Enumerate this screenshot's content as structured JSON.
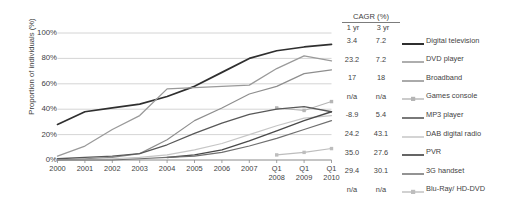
{
  "chart_data": {
    "type": "line",
    "title": "",
    "xlabel": "",
    "ylabel": "Proportion of individuals (%)",
    "ylim": [
      0,
      100
    ],
    "grid": true,
    "legend_position": "right",
    "y_ticks": [
      "0%",
      "20%",
      "40%",
      "60%",
      "80%",
      "100%"
    ],
    "y_tick_values": [
      0,
      20,
      40,
      60,
      80,
      100
    ],
    "categories": [
      "2000",
      "2001",
      "2002",
      "2003",
      "2004",
      "2005",
      "2006",
      "2007",
      "Q1 2008",
      "Q1 2009",
      "Q1 2010"
    ],
    "x_tick_lines": [
      [
        "2000",
        ""
      ],
      [
        "2001",
        ""
      ],
      [
        "2002",
        ""
      ],
      [
        "2003",
        ""
      ],
      [
        "2004",
        ""
      ],
      [
        "2005",
        ""
      ],
      [
        "2006",
        ""
      ],
      [
        "2007",
        ""
      ],
      [
        "Q1",
        "2008"
      ],
      [
        "Q1",
        "2009"
      ],
      [
        "Q1",
        "2010"
      ]
    ],
    "series": [
      {
        "name": "Digital television",
        "color": "#2f2f2f",
        "width": 1.7,
        "style": "solid",
        "marker": "none",
        "cagr_1yr": "3.4",
        "cagr_3yr": "7.2",
        "values": [
          28,
          38,
          41,
          44,
          50,
          58,
          69,
          80,
          86,
          89,
          91
        ]
      },
      {
        "name": "DVD player",
        "color": "#9a9a9a",
        "width": 1.3,
        "style": "solid",
        "marker": "none",
        "cagr_1yr": "23.2",
        "cagr_3yr": "7.2",
        "values": [
          3,
          11,
          24,
          35,
          56,
          57,
          58,
          59,
          72,
          82,
          78
        ]
      },
      {
        "name": "Broadband",
        "color": "#8e8e8e",
        "width": 1.2,
        "style": "solid",
        "marker": "none",
        "cagr_1yr": "17",
        "cagr_3yr": "18",
        "values": [
          0,
          1,
          2,
          5,
          16,
          31,
          41,
          52,
          58,
          68,
          71
        ]
      },
      {
        "name": "Games console",
        "color": "#b5b5b5",
        "width": 1.1,
        "style": "marker-line",
        "marker": "square",
        "cagr_1yr": "n/a",
        "cagr_3yr": "n/a",
        "values": [
          null,
          null,
          null,
          null,
          null,
          null,
          null,
          null,
          41,
          39,
          46
        ]
      },
      {
        "name": "MP3 player",
        "color": "#585858",
        "width": 1.3,
        "style": "solid",
        "marker": "none",
        "cagr_1yr": "-8.9",
        "cagr_3yr": "5.4",
        "values": [
          1,
          2,
          3,
          5,
          12,
          21,
          29,
          36,
          40,
          42,
          38
        ]
      },
      {
        "name": "DAB digital radio",
        "color": "#c6c6c6",
        "width": 1.2,
        "style": "solid",
        "marker": "none",
        "cagr_1yr": "24.2",
        "cagr_3yr": "43.1",
        "values": [
          0,
          0,
          1,
          2,
          4,
          8,
          13,
          20,
          27,
          33,
          35
        ]
      },
      {
        "name": "PVR",
        "color": "#4a4a4a",
        "width": 1.4,
        "style": "solid",
        "marker": "none",
        "cagr_1yr": "35.0",
        "cagr_3yr": "27.6",
        "values": [
          null,
          null,
          null,
          null,
          2,
          4,
          8,
          15,
          23,
          31,
          38
        ]
      },
      {
        "name": "3G handset",
        "color": "#6f6f6f",
        "width": 1.2,
        "style": "solid",
        "marker": "none",
        "cagr_1yr": "29.4",
        "cagr_3yr": "30.1",
        "values": [
          0,
          0,
          0,
          1,
          2,
          3,
          6,
          11,
          17,
          24,
          31
        ]
      },
      {
        "name": "Blu-Ray/ HD-DVD",
        "color": "#bdbdbd",
        "width": 1.1,
        "style": "marker-line",
        "marker": "square",
        "cagr_1yr": "n/a",
        "cagr_3yr": "n/a",
        "values": [
          null,
          null,
          null,
          null,
          null,
          null,
          null,
          null,
          4,
          6,
          9
        ]
      }
    ]
  },
  "legend": {
    "cagr_header": "CAGR (%)",
    "col_1yr": "1 yr",
    "col_3yr": "3 yr"
  }
}
